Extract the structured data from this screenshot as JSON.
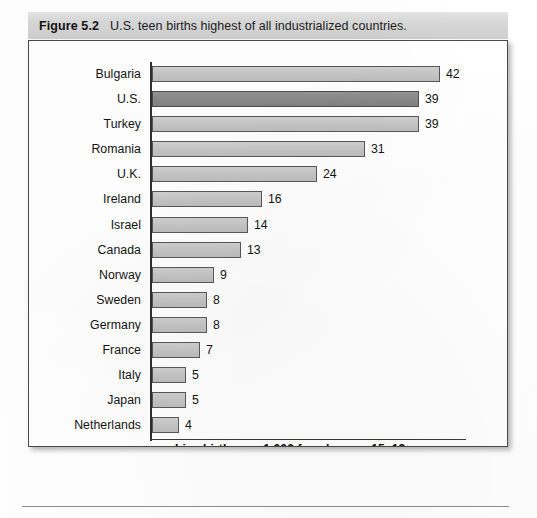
{
  "figure": {
    "number_label": "Figure 5.2",
    "caption": "U.S. teen births highest of all industrialized countries."
  },
  "chart_data": {
    "type": "bar",
    "orientation": "horizontal",
    "title": "U.S. teen births highest of all industrialized countries.",
    "xlabel": "Live births per 1,000 females age 15–19 years",
    "ylabel": "",
    "xlim": [
      0,
      42
    ],
    "grid": false,
    "legend": null,
    "highlight_category": "U.S.",
    "highlight_note": "The U.S. bar is shaded darker than all other bars.",
    "categories": [
      "Bulgaria",
      "U.S.",
      "Turkey",
      "Romania",
      "U.K.",
      "Ireland",
      "Israel",
      "Canada",
      "Norway",
      "Sweden",
      "Germany",
      "France",
      "Italy",
      "Japan",
      "Netherlands"
    ],
    "values": [
      42,
      39,
      39,
      31,
      24,
      16,
      14,
      13,
      9,
      8,
      8,
      7,
      5,
      5,
      4
    ],
    "value_labels": [
      "42",
      "39",
      "39",
      "31",
      "24",
      "16",
      "14",
      "13",
      "9",
      "8",
      "8",
      "7",
      "5",
      "5",
      "4"
    ],
    "bars": [
      {
        "category": "Bulgaria",
        "value": 42,
        "label": "42",
        "highlighted": false
      },
      {
        "category": "U.S.",
        "value": 39,
        "label": "39",
        "highlighted": true
      },
      {
        "category": "Turkey",
        "value": 39,
        "label": "39",
        "highlighted": false
      },
      {
        "category": "Romania",
        "value": 31,
        "label": "31",
        "highlighted": false
      },
      {
        "category": "U.K.",
        "value": 24,
        "label": "24",
        "highlighted": false
      },
      {
        "category": "Ireland",
        "value": 16,
        "label": "16",
        "highlighted": false
      },
      {
        "category": "Israel",
        "value": 14,
        "label": "14",
        "highlighted": false
      },
      {
        "category": "Canada",
        "value": 13,
        "label": "13",
        "highlighted": false
      },
      {
        "category": "Norway",
        "value": 9,
        "label": "9",
        "highlighted": false
      },
      {
        "category": "Sweden",
        "value": 8,
        "label": "8",
        "highlighted": false
      },
      {
        "category": "Germany",
        "value": 8,
        "label": "8",
        "highlighted": false
      },
      {
        "category": "France",
        "value": 7,
        "label": "7",
        "highlighted": false
      },
      {
        "category": "Italy",
        "value": 5,
        "label": "5",
        "highlighted": false
      },
      {
        "category": "Japan",
        "value": 5,
        "label": "5",
        "highlighted": false
      },
      {
        "category": "Netherlands",
        "value": 4,
        "label": "4",
        "highlighted": false
      }
    ]
  },
  "colors": {
    "bar_fill": "#c6c6c6",
    "bar_fill_highlight": "#8a8a8a",
    "bar_stroke": "#585858",
    "axis": "#2e2e2e",
    "caption_band": "#d8d8d8",
    "frame_border": "#4a4a4a",
    "text": "#141414"
  }
}
